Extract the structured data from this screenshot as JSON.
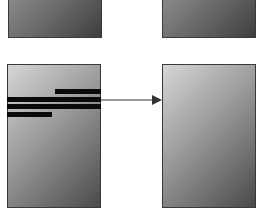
{
  "diagram": {
    "panels": [
      {
        "id": "top-left",
        "x": 8,
        "y": -4,
        "w": 94,
        "h": 42,
        "style": "dark"
      },
      {
        "id": "top-right",
        "x": 162,
        "y": -4,
        "w": 94,
        "h": 42,
        "style": "dark"
      },
      {
        "id": "bottom-left",
        "x": 7,
        "y": 64,
        "w": 94,
        "h": 144,
        "style": "light"
      },
      {
        "id": "bottom-right",
        "x": 162,
        "y": 64,
        "w": 94,
        "h": 144,
        "style": "light"
      }
    ],
    "bars": [
      {
        "x": 55,
        "y": 89,
        "w": 46,
        "h": 5
      },
      {
        "x": 7,
        "y": 97,
        "w": 94,
        "h": 5
      },
      {
        "x": 7,
        "y": 104,
        "w": 94,
        "h": 5
      },
      {
        "x": 7,
        "y": 112,
        "w": 45,
        "h": 5
      }
    ],
    "arrow": {
      "from": {
        "x": 101,
        "y": 100
      },
      "to": {
        "x": 162,
        "y": 100
      },
      "color": "#333333"
    },
    "colors": {
      "border": "#3a3a3a",
      "bar": "#0a0a0a",
      "background": "#ffffff"
    }
  }
}
